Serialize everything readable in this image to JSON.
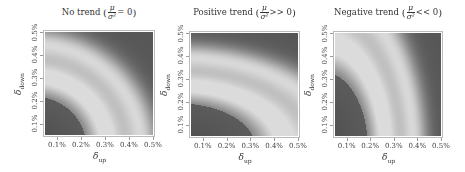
{
  "chart_data": [
    {
      "type": "heatmap",
      "title": "No trend",
      "condition": "μ/σ² = 0",
      "title_num": "μ",
      "title_den": "σ²",
      "title_rel": "= 0",
      "xlabel": "δ",
      "xlabel_sub": "up",
      "ylabel": "δ",
      "ylabel_sub": "down",
      "x_ticks": [
        "0.1%",
        "0.2%",
        "0.3%",
        "0.4%",
        "0.5%"
      ],
      "y_ticks": [
        "0.1%",
        "0.2%",
        "0.3%",
        "0.4%",
        "0.5%"
      ],
      "xlim": [
        0.0005,
        0.005
      ],
      "ylim": [
        0.0005,
        0.005
      ],
      "colormap": "grayscale (dark = low, light = high)",
      "pattern": "concentric quarter-circle bands centred at origin: dark near (0,0), light band at radius ~0.3%, mid-gray band, light band at radius ~0.45%, dark at top-right",
      "bands": {
        "center": [
          0.0,
          0.0
        ],
        "scale_x": 1.0,
        "scale_y": 1.0
      }
    },
    {
      "type": "heatmap",
      "title": "Positive trend",
      "condition": "μ/σ² >> 0",
      "title_num": "μ",
      "title_den": "σ²",
      "title_rel": ">> 0",
      "xlabel": "δ",
      "xlabel_sub": "up",
      "ylabel": "δ",
      "ylabel_sub": "down",
      "x_ticks": [
        "0.1%",
        "0.2%",
        "0.3%",
        "0.4%",
        "0.5%"
      ],
      "y_ticks": [
        "0.1%",
        "0.2%",
        "0.3%",
        "0.4%",
        "0.5%"
      ],
      "xlim": [
        0.0005,
        0.005
      ],
      "ylim": [
        0.0005,
        0.005
      ],
      "colormap": "grayscale (dark = low, light = high)",
      "pattern": "bands stretched horizontally (optimum shifted toward larger δ_up, smaller δ_down)",
      "bands": {
        "center": [
          0.0,
          0.0
        ],
        "scale_x": 1.45,
        "scale_y": 0.88
      }
    },
    {
      "type": "heatmap",
      "title": "Negative trend",
      "condition": "μ/σ² << 0",
      "title_num": "μ",
      "title_den": "σ²",
      "title_rel": "<< 0",
      "xlabel": "δ",
      "xlabel_sub": "up",
      "ylabel": "δ",
      "ylabel_sub": "down",
      "x_ticks": [
        "0.1%",
        "0.2%",
        "0.3%",
        "0.4%",
        "0.5%"
      ],
      "y_ticks": [
        "0.1%",
        "0.2%",
        "0.3%",
        "0.4%",
        "0.5%"
      ],
      "xlim": [
        0.0005,
        0.005
      ],
      "ylim": [
        0.0005,
        0.005
      ],
      "colormap": "grayscale (dark = low, light = high)",
      "pattern": "bands stretched vertically (optimum shifted toward larger δ_down, smaller δ_up)",
      "bands": {
        "center": [
          0.0,
          0.0
        ],
        "scale_x": 0.85,
        "scale_y": 1.5
      }
    }
  ],
  "layout": {
    "panels": [
      {
        "left": 0,
        "plot": {
          "x": 45,
          "y": 32,
          "w": 108,
          "h": 103
        }
      },
      {
        "left": 150,
        "plot": {
          "x": 191,
          "y": 33,
          "w": 107,
          "h": 103
        }
      },
      {
        "left": 296,
        "plot": {
          "x": 335,
          "y": 33,
          "w": 106,
          "h": 103
        }
      }
    ]
  }
}
